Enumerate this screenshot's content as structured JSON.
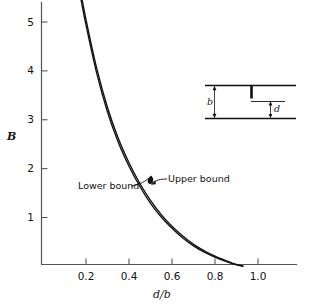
{
  "chart_data": {
    "type": "line",
    "title": "",
    "xlabel": "d/b",
    "ylabel": "B",
    "xlim": [
      0.11,
      1.14
    ],
    "ylim": [
      0,
      5.75
    ],
    "xticks": [
      0.2,
      0.4,
      0.6,
      0.8,
      1.0
    ],
    "xticklabels": [
      "0.2",
      "0.4",
      "0.6",
      "0.8",
      "1.0"
    ],
    "yticks": [
      1,
      2,
      3,
      4,
      5
    ],
    "yticklabels": [
      "1",
      "2",
      "3",
      "4",
      "5"
    ],
    "grid": false,
    "legend_position": "inline-annotations",
    "series": [
      {
        "name": "Upper bound",
        "x": [
          0.175,
          0.2,
          0.25,
          0.3,
          0.35,
          0.4,
          0.45,
          0.5,
          0.55,
          0.6,
          0.65,
          0.7,
          0.75,
          0.8,
          0.85,
          0.9,
          0.93
        ],
        "values": [
          5.62,
          5.05,
          4.05,
          3.25,
          2.62,
          2.12,
          1.7,
          1.35,
          1.06,
          0.82,
          0.62,
          0.45,
          0.32,
          0.21,
          0.12,
          0.04,
          0.01
        ]
      },
      {
        "name": "Lower bound",
        "x": [
          0.175,
          0.2,
          0.25,
          0.3,
          0.35,
          0.4,
          0.45,
          0.5,
          0.55,
          0.6,
          0.65,
          0.7,
          0.75,
          0.8,
          0.85,
          0.9,
          0.93
        ],
        "values": [
          5.5,
          4.94,
          3.95,
          3.16,
          2.54,
          2.05,
          1.64,
          1.29,
          1.01,
          0.78,
          0.58,
          0.42,
          0.29,
          0.19,
          0.1,
          0.03,
          0.0
        ]
      }
    ],
    "annotations": [
      {
        "text": "Upper bound",
        "target_x": 0.49,
        "target_y": 1.73
      },
      {
        "text": "Lower bound",
        "target_x": 0.49,
        "target_y": 1.73
      }
    ]
  },
  "axes": {
    "y_title": "B",
    "x_title": "d/b",
    "yticklabels": [
      "5",
      "4",
      "3",
      "2",
      "1"
    ],
    "xticklabels": [
      "0.2",
      "0.4",
      "0.6",
      "0.8",
      "1.0"
    ]
  },
  "annotations": {
    "upper_bound": "Upper bound",
    "lower_bound": "Lower bound"
  },
  "inset": {
    "label_b": "b",
    "label_d": "d"
  },
  "colors": {
    "curve": "#111111",
    "axis": "#4a4a4a",
    "text": "#111111"
  }
}
